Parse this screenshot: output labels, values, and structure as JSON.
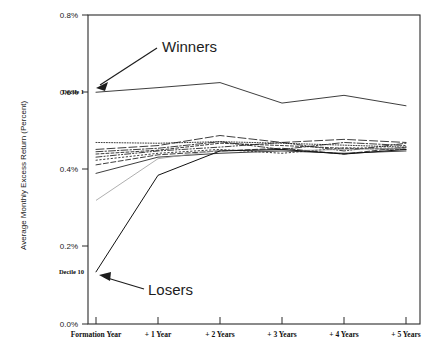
{
  "chart_data": {
    "type": "line",
    "title": "",
    "xlabel": "",
    "ylabel": "Average Monthly Excess Return (Percent)",
    "categories": [
      "Formation Year",
      "+ 1 Year",
      "+ 2 Years",
      "+ 3 Years",
      "+ 4 Years",
      "+ 5 Years"
    ],
    "x": [
      0,
      1,
      2,
      3,
      4,
      5
    ],
    "ylim": [
      0.0,
      0.8
    ],
    "yticks": [
      0.0,
      0.2,
      0.4,
      0.6,
      0.8
    ],
    "ytick_labels": [
      "0.0%",
      "0.2%",
      "0.4%",
      "0.6%",
      "0.8%"
    ],
    "grid": false,
    "legend": "none",
    "annotations": [
      {
        "text": "Winners",
        "target_series": "Decile 1"
      },
      {
        "text": "Losers",
        "target_series": "Decile 10"
      },
      {
        "text": "Decile 1",
        "target_series": "Decile 1"
      },
      {
        "text": "Decile 10",
        "target_series": "Decile 10"
      }
    ],
    "series": [
      {
        "name": "Decile 1",
        "style": "solid",
        "values": [
          0.6,
          0.612,
          0.625,
          0.572,
          0.592,
          0.565
        ]
      },
      {
        "name": "Decile 2",
        "style": "dotted-fine",
        "values": [
          0.47,
          0.468,
          0.472,
          0.468,
          0.463,
          0.458
        ]
      },
      {
        "name": "Decile 3",
        "style": "dashed-long",
        "values": [
          0.452,
          0.462,
          0.488,
          0.47,
          0.478,
          0.47
        ]
      },
      {
        "name": "Decile 4",
        "style": "dash-dot",
        "values": [
          0.446,
          0.455,
          0.472,
          0.452,
          0.47,
          0.462
        ]
      },
      {
        "name": "Decile 5",
        "style": "dashed-short",
        "values": [
          0.44,
          0.45,
          0.468,
          0.462,
          0.455,
          0.452
        ]
      },
      {
        "name": "Decile 6",
        "style": "dash-dot-dot",
        "values": [
          0.432,
          0.448,
          0.458,
          0.47,
          0.448,
          0.468
        ]
      },
      {
        "name": "Decile 7",
        "style": "dotted-coarse",
        "values": [
          0.424,
          0.442,
          0.452,
          0.442,
          0.456,
          0.455
        ]
      },
      {
        "name": "Decile 8",
        "style": "dashed-medium",
        "values": [
          0.412,
          0.438,
          0.448,
          0.455,
          0.44,
          0.458
        ]
      },
      {
        "name": "Decile 9",
        "style": "solid-thin",
        "values": [
          0.39,
          0.432,
          0.442,
          0.448,
          0.442,
          0.448
        ]
      },
      {
        "name": "Decile 9b",
        "style": "solid-faint",
        "values": [
          0.32,
          0.428,
          0.45,
          0.448,
          0.452,
          0.455
        ]
      },
      {
        "name": "Decile 10",
        "style": "solid-bold",
        "values": [
          0.135,
          0.385,
          0.448,
          0.452,
          0.44,
          0.452
        ]
      }
    ]
  },
  "axis": {
    "y_title": "Average Monthly Excess Return (Percent)",
    "y_labels": [
      "0.8%",
      "0.6%",
      "0.4%",
      "0.2%",
      "0.0%"
    ],
    "x_labels": [
      "Formation Year",
      "+ 1 Year",
      "+ 2 Years",
      "+ 3 Years",
      "+ 4 Years",
      "+ 5 Years"
    ]
  },
  "labels": {
    "winners": "Winners",
    "losers": "Losers",
    "decile_1": "Decile 1",
    "decile_10": "Decile 10"
  },
  "colors": {
    "line": "#1b1b1b",
    "frame": "#2b2b2b",
    "text": "#1a1a1a",
    "background": "#ffffff"
  }
}
